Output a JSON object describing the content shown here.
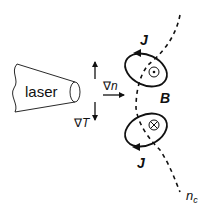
{
  "diagram": {
    "colors": {
      "line": "#111111",
      "background": "#ffffff"
    },
    "laser": {
      "label": "laser"
    },
    "gradients": {
      "density_label_symbol": "∇",
      "density_label_var": "n",
      "temperature_label_symbol": "∇",
      "temperature_label_var": "T"
    },
    "current_loops": [
      {
        "label": "J",
        "position": "upper",
        "field_symbol": "dot",
        "field_meaning": "B out of page",
        "direction": "counterclockwise"
      },
      {
        "label": "J",
        "position": "lower",
        "field_symbol": "cross",
        "field_meaning": "B into page",
        "direction": "clockwise"
      }
    ],
    "magnetic_field": {
      "label": "B"
    },
    "critical_density": {
      "label_main": "n",
      "label_sub": "c",
      "style": "dashed contour"
    }
  }
}
